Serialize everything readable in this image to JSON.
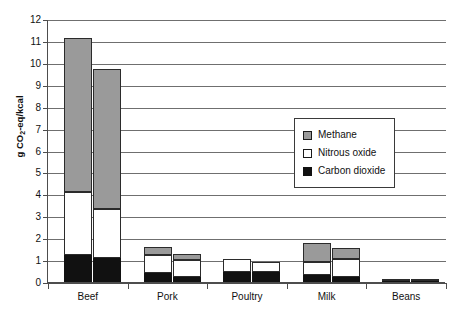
{
  "chart_data": {
    "type": "bar",
    "title": "",
    "subtitle": "",
    "xlabel": "",
    "ylabel": "g CO2-eq/kcal",
    "ylabel_parts": {
      "pre": "g CO",
      "sub": "2",
      "post": "-eq/kcal"
    },
    "categories": [
      "Beef",
      "Pork",
      "Poultry",
      "Milk",
      "Beans"
    ],
    "ylim": [
      0,
      12
    ],
    "yticks": [
      0,
      1,
      2,
      3,
      4,
      5,
      6,
      7,
      8,
      9,
      10,
      11,
      12
    ],
    "ytick_labels": [
      "0",
      "1",
      "2",
      "3",
      "4",
      "5",
      "6",
      "7",
      "8",
      "9",
      "10",
      "11",
      "12"
    ],
    "grid": true,
    "grid_axis": "y",
    "stacked": true,
    "bars_per_category": 2,
    "legend_position": "center-right",
    "series": [
      {
        "name": "Carbon dioxide",
        "key": "co2",
        "color": "#111111",
        "swatch": "black-filled-square",
        "values_bar1": [
          1.25,
          0.4,
          0.45,
          0.3,
          0.05
        ],
        "values_bar2": [
          1.1,
          0.25,
          0.45,
          0.25,
          0.05
        ]
      },
      {
        "name": "Nitrous oxide",
        "key": "n2o",
        "color": "#ffffff",
        "swatch": "white-open-square",
        "values_bar1": [
          2.85,
          0.85,
          0.6,
          0.6,
          0.04
        ],
        "values_bar2": [
          2.25,
          0.75,
          0.45,
          0.8,
          0.04
        ]
      },
      {
        "name": "Methane",
        "key": "ch4",
        "color": "#9a9a9a",
        "swatch": "gray-filled-square",
        "values_bar1": [
          7.05,
          0.35,
          0.0,
          0.9,
          0.0
        ],
        "values_bar2": [
          6.35,
          0.3,
          0.0,
          0.5,
          0.0
        ]
      }
    ],
    "totals_bar1": [
      11.15,
      1.6,
      1.05,
      1.8,
      0.09
    ],
    "totals_bar2": [
      9.7,
      1.3,
      0.9,
      1.55,
      0.09
    ]
  },
  "legend": {
    "entries": [
      {
        "label": "Methane"
      },
      {
        "label": "Nitrous oxide"
      },
      {
        "label": "Carbon dioxide"
      }
    ]
  }
}
